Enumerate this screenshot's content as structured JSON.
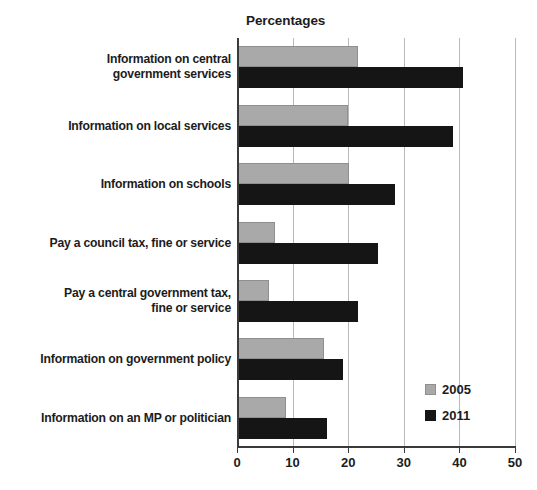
{
  "chart_data": {
    "type": "bar",
    "orientation": "horizontal",
    "title": "Percentages",
    "xlabel": "",
    "ylabel": "",
    "xlim": [
      0,
      50
    ],
    "xticks": [
      0,
      10,
      20,
      30,
      40,
      50
    ],
    "grid": true,
    "legend_position": "inside-right-bottom",
    "categories": [
      "Information on central government services",
      "Information on local services",
      "Information on schools",
      "Pay a council tax, fine or service",
      "Pay a central government tax, fine or service",
      "Information on government policy",
      "Information on an MP or politician"
    ],
    "category_lines": [
      [
        "Information on central",
        "government services"
      ],
      [
        "Information on local services"
      ],
      [
        "Information on schools"
      ],
      [
        "Pay a council tax, fine or service"
      ],
      [
        "Pay a central government tax,",
        "fine or service"
      ],
      [
        "Information on government policy"
      ],
      [
        "Information on an MP or politician"
      ]
    ],
    "series": [
      {
        "name": "2005",
        "color": "#a9a9a9",
        "values": [
          21.7,
          20.0,
          20.2,
          6.8,
          5.8,
          15.7,
          8.8
        ]
      },
      {
        "name": "2011",
        "color": "#151515",
        "values": [
          40.6,
          38.8,
          28.4,
          25.3,
          21.8,
          19.0,
          16.2
        ]
      }
    ]
  },
  "legend": {
    "items": [
      {
        "label": "2005",
        "swatch": "gray-swatch-icon"
      },
      {
        "label": "2011",
        "swatch": "black-swatch-icon"
      }
    ]
  },
  "axis": {
    "tick_labels": [
      "0",
      "10",
      "20",
      "30",
      "40",
      "50"
    ]
  }
}
